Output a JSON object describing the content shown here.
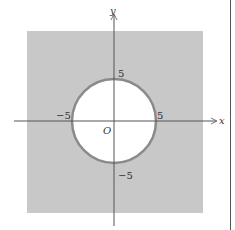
{
  "diagram": {
    "axes": {
      "x_label": "x",
      "y_label": "y",
      "origin_label": "O"
    },
    "ticks": {
      "x_pos": "5",
      "x_neg": "−5",
      "y_pos": "5",
      "y_neg": "−5"
    },
    "circle": {
      "center": [
        0,
        0
      ],
      "radius": 5
    },
    "colors": {
      "shaded_region": "#c8c8c8",
      "circle_stroke": "#8a8a8a",
      "axis": "#555555",
      "disk_fill": "#ffffff"
    }
  }
}
